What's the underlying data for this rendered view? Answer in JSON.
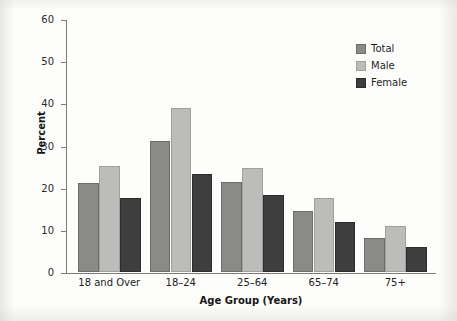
{
  "chart_data": {
    "type": "bar",
    "title": "",
    "xlabel": "Age Group (Years)",
    "ylabel": "Percent",
    "categories": [
      "18 and Over",
      "18–24",
      "25–64",
      "65–74",
      "75+"
    ],
    "series": [
      {
        "name": "Total",
        "color": "#8a8a88",
        "values": [
          21.2,
          31.1,
          21.4,
          14.5,
          8.0
        ]
      },
      {
        "name": "Male",
        "color": "#bcbcba",
        "values": [
          25.1,
          38.8,
          24.6,
          17.5,
          10.8
        ]
      },
      {
        "name": "Female",
        "color": "#3e3e3e",
        "values": [
          17.5,
          23.2,
          18.2,
          11.9,
          5.9
        ]
      }
    ],
    "ylim": [
      0,
      60
    ],
    "yticks": [
      0,
      10,
      20,
      30,
      40,
      50,
      60
    ],
    "ytick_labels": [
      "0",
      "10",
      "20",
      "30",
      "40",
      "50",
      "60"
    ],
    "grid": false,
    "legend_position": "top-right",
    "legend_entries": [
      "Total",
      "Male",
      "Female"
    ]
  }
}
